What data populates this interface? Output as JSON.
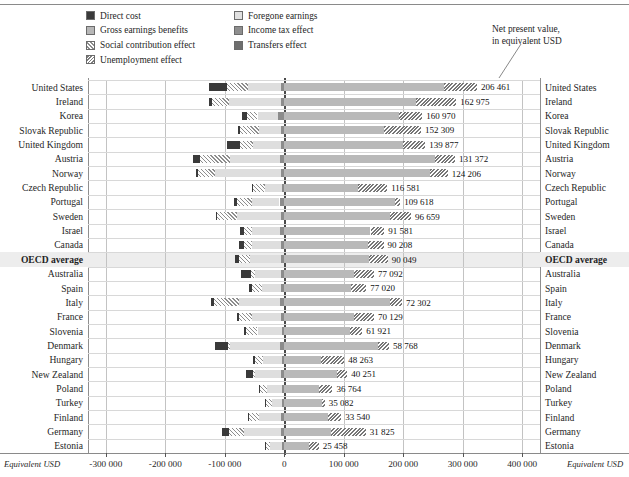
{
  "legend": {
    "column1": [
      {
        "label": "Direct cost",
        "icon": "swatch-direct-cost"
      },
      {
        "label": "Gross earnings benefits",
        "icon": "swatch-gross-earnings-benefits"
      },
      {
        "label": "Social contribution effect",
        "icon": "swatch-social-contribution-effect"
      },
      {
        "label": "Unemployment effect",
        "icon": "swatch-unemployment-effect"
      }
    ],
    "column2": [
      {
        "label": "Foregone earnings",
        "icon": "swatch-foregone-earnings"
      },
      {
        "label": "Income tax effect",
        "icon": "swatch-income-tax-effect"
      },
      {
        "label": "Transfers effect",
        "icon": "swatch-transfers-effect"
      }
    ]
  },
  "annotation": {
    "line1": "Net present value,",
    "line2": "in equivalent USD"
  },
  "axis": {
    "unit_left": "Equivalent USD",
    "unit_right": "Equivalent USD",
    "ticks": [
      "-300 000",
      "-200 000",
      "-100 000",
      "0",
      "100 000",
      "200 000",
      "300 000",
      "400 000"
    ],
    "tick_values": [
      -300000,
      -200000,
      -100000,
      0,
      100000,
      200000,
      300000,
      400000
    ]
  },
  "chart_data": {
    "type": "bar",
    "orientation": "horizontal",
    "stacked": true,
    "title": "",
    "xlabel": "Equivalent USD",
    "ylabel": "",
    "xlim": [
      -330000,
      430000
    ],
    "grid": true,
    "legend_position": "top",
    "series": [
      {
        "name": "Direct cost",
        "key": "direct_cost"
      },
      {
        "name": "Foregone earnings",
        "key": "foregone_earnings"
      },
      {
        "name": "Gross earnings benefits",
        "key": "gross_earnings_benefits"
      },
      {
        "name": "Income tax effect",
        "key": "income_tax_effect"
      },
      {
        "name": "Social contribution effect",
        "key": "social_contribution_effect"
      },
      {
        "name": "Transfers effect",
        "key": "transfers_effect"
      },
      {
        "name": "Unemployment effect",
        "key": "unemployment_effect"
      }
    ],
    "categories": [
      "United States",
      "Ireland",
      "Korea",
      "Slovak Republic",
      "United Kingdom",
      "Austria",
      "Norway",
      "Czech Republic",
      "Portugal",
      "Sweden",
      "Israel",
      "Canada",
      "OECD average",
      "Australia",
      "Spain",
      "Italy",
      "France",
      "Slovenia",
      "Denmark",
      "Hungary",
      "New Zealand",
      "Poland",
      "Turkey",
      "Finland",
      "Germany",
      "Estonia"
    ],
    "net_present_value_labels": [
      "206 461",
      "162 975",
      "160 970",
      "152 309",
      "139 877",
      "131 372",
      "124 206",
      "116 581",
      "109 618",
      "96 659",
      "91 581",
      "90 208",
      "90 049",
      "77 092",
      "77 020",
      "72 302",
      "70 129",
      "61 921",
      "58 768",
      "48 263",
      "40 251",
      "36 764",
      "35 082",
      "33 540",
      "31 825",
      "25 458"
    ],
    "net_present_value": [
      206461,
      162975,
      160970,
      152309,
      139877,
      131372,
      124206,
      116581,
      109618,
      96659,
      91581,
      90208,
      90049,
      77092,
      77020,
      72302,
      70129,
      61921,
      58768,
      48263,
      40251,
      36764,
      35082,
      33540,
      31825,
      25458
    ],
    "rows": [
      {
        "country": "United States",
        "npv": 206461,
        "direct_cost": -29000,
        "social_contribution_effect": -36000,
        "foregone_earnings": -55000,
        "income_tax_effect": -6000,
        "gross_earnings_benefits": 268000,
        "unemployment_effect": 56000,
        "transfers_effect": -4000,
        "neg_total": -126000,
        "pos_total": 324000
      },
      {
        "country": "Ireland",
        "npv": 162975,
        "direct_cost": -5000,
        "social_contribution_effect": -29000,
        "foregone_earnings": -88000,
        "income_tax_effect": -5000,
        "gross_earnings_benefits": 222000,
        "unemployment_effect": 67000,
        "transfers_effect": -3000,
        "neg_total": -127000,
        "pos_total": 289000
      },
      {
        "country": "Korea",
        "npv": 160970,
        "direct_cost": -8000,
        "social_contribution_effect": -18000,
        "foregone_earnings": -35000,
        "income_tax_effect": -10000,
        "gross_earnings_benefits": 193000,
        "unemployment_effect": 39000,
        "transfers_effect": -1000,
        "neg_total": -71000,
        "pos_total": 232000
      },
      {
        "country": "Slovak Republic",
        "npv": 152309,
        "direct_cost": -3000,
        "social_contribution_effect": -32000,
        "foregone_earnings": -37000,
        "income_tax_effect": -5000,
        "gross_earnings_benefits": 168000,
        "unemployment_effect": 62000,
        "transfers_effect": -1000,
        "neg_total": -77000,
        "pos_total": 230000
      },
      {
        "country": "United Kingdom",
        "npv": 139877,
        "direct_cost": -21000,
        "social_contribution_effect": -23000,
        "foregone_earnings": -47000,
        "income_tax_effect": -5000,
        "gross_earnings_benefits": 200000,
        "unemployment_effect": 37000,
        "transfers_effect": -2000,
        "neg_total": -96000,
        "pos_total": 237000
      },
      {
        "country": "Austria",
        "npv": 131372,
        "direct_cost": -12000,
        "social_contribution_effect": -50000,
        "foregone_earnings": -85000,
        "income_tax_effect": -7000,
        "gross_earnings_benefits": 253000,
        "unemployment_effect": 34000,
        "transfers_effect": -2000,
        "neg_total": -154000,
        "pos_total": 287000
      },
      {
        "country": "Norway",
        "npv": 124206,
        "direct_cost": -4000,
        "social_contribution_effect": -29000,
        "foregone_earnings": -110000,
        "income_tax_effect": -6000,
        "gross_earnings_benefits": 245000,
        "unemployment_effect": 30000,
        "transfers_effect": -2000,
        "neg_total": -149000,
        "pos_total": 275000
      },
      {
        "country": "Czech Republic",
        "npv": 116581,
        "direct_cost": -3000,
        "social_contribution_effect": -19000,
        "foregone_earnings": -29000,
        "income_tax_effect": -4000,
        "gross_earnings_benefits": 124000,
        "unemployment_effect": 49000,
        "transfers_effect": -1000,
        "neg_total": -55000,
        "pos_total": 173000
      },
      {
        "country": "Portugal",
        "npv": 109618,
        "direct_cost": -5000,
        "social_contribution_effect": -24000,
        "foregone_earnings": -47000,
        "income_tax_effect": -8000,
        "gross_earnings_benefits": 187000,
        "unemployment_effect": 8000,
        "transfers_effect": -1000,
        "neg_total": -85000,
        "pos_total": 195000
      },
      {
        "country": "Sweden",
        "npv": 96659,
        "direct_cost": -2000,
        "social_contribution_effect": -34000,
        "foregone_earnings": -73000,
        "income_tax_effect": -6000,
        "gross_earnings_benefits": 178000,
        "unemployment_effect": 35000,
        "transfers_effect": -2000,
        "neg_total": -115000,
        "pos_total": 213000
      },
      {
        "country": "Israel",
        "npv": 91581,
        "direct_cost": -8000,
        "social_contribution_effect": -12000,
        "foregone_earnings": -48000,
        "income_tax_effect": -7000,
        "gross_earnings_benefits": 145000,
        "unemployment_effect": 23000,
        "transfers_effect": -1000,
        "neg_total": -76000,
        "pos_total": 168000
      },
      {
        "country": "Canada",
        "npv": 90208,
        "direct_cost": -9000,
        "social_contribution_effect": -13000,
        "foregone_earnings": -48000,
        "income_tax_effect": -6000,
        "gross_earnings_benefits": 140000,
        "unemployment_effect": 27000,
        "transfers_effect": -1000,
        "neg_total": -77000,
        "pos_total": 167000
      },
      {
        "country": "OECD average",
        "npv": 90049,
        "direct_cost": -7000,
        "social_contribution_effect": -19000,
        "foregone_earnings": -51000,
        "income_tax_effect": -6000,
        "gross_earnings_benefits": 142000,
        "unemployment_effect": 32000,
        "transfers_effect": -1000,
        "neg_total": -84000,
        "pos_total": 174000
      },
      {
        "country": "Australia",
        "npv": 77092,
        "direct_cost": -17000,
        "social_contribution_effect": -7000,
        "foregone_earnings": -44000,
        "income_tax_effect": -5000,
        "gross_earnings_benefits": 118000,
        "unemployment_effect": 33000,
        "transfers_effect": -1000,
        "neg_total": -73000,
        "pos_total": 151000
      },
      {
        "country": "Spain",
        "npv": 77020,
        "direct_cost": -5000,
        "social_contribution_effect": -18000,
        "foregone_earnings": -32000,
        "income_tax_effect": -5000,
        "gross_earnings_benefits": 113000,
        "unemployment_effect": 25000,
        "transfers_effect": -1000,
        "neg_total": -60000,
        "pos_total": 138000
      },
      {
        "country": "Italy",
        "npv": 72302,
        "direct_cost": -6000,
        "social_contribution_effect": -42000,
        "foregone_earnings": -69000,
        "income_tax_effect": -7000,
        "gross_earnings_benefits": 178000,
        "unemployment_effect": 20000,
        "transfers_effect": -1000,
        "neg_total": -124000,
        "pos_total": 198000
      },
      {
        "country": "France",
        "npv": 70129,
        "direct_cost": -4000,
        "social_contribution_effect": -22000,
        "foregone_earnings": -48000,
        "income_tax_effect": -6000,
        "gross_earnings_benefits": 118000,
        "unemployment_effect": 33000,
        "transfers_effect": -1000,
        "neg_total": -80000,
        "pos_total": 151000
      },
      {
        "country": "Slovenia",
        "npv": 61921,
        "direct_cost": -3000,
        "social_contribution_effect": -20000,
        "foregone_earnings": -41000,
        "income_tax_effect": -4000,
        "gross_earnings_benefits": 110000,
        "unemployment_effect": 21000,
        "transfers_effect": -1000,
        "neg_total": -68000,
        "pos_total": 131000
      },
      {
        "country": "Denmark",
        "npv": 58768,
        "direct_cost": -22000,
        "social_contribution_effect": -3000,
        "foregone_earnings": -85000,
        "income_tax_effect": -7000,
        "gross_earnings_benefits": 158000,
        "unemployment_effect": 18000,
        "transfers_effect": -2000,
        "neg_total": -117000,
        "pos_total": 176000
      },
      {
        "country": "Hungary",
        "npv": 48263,
        "direct_cost": -3000,
        "social_contribution_effect": -14000,
        "foregone_earnings": -31000,
        "income_tax_effect": -4000,
        "gross_earnings_benefits": 61000,
        "unemployment_effect": 40000,
        "transfers_effect": -1000,
        "neg_total": -52000,
        "pos_total": 101000
      },
      {
        "country": "New Zealand",
        "npv": 40251,
        "direct_cost": -12000,
        "social_contribution_effect": -4000,
        "foregone_earnings": -44000,
        "income_tax_effect": -5000,
        "gross_earnings_benefits": 88000,
        "unemployment_effect": 18000,
        "transfers_effect": -1000,
        "neg_total": -65000,
        "pos_total": 106000
      },
      {
        "country": "Poland",
        "npv": 36764,
        "direct_cost": -3000,
        "social_contribution_effect": -11000,
        "foregone_earnings": -26000,
        "income_tax_effect": -3000,
        "gross_earnings_benefits": 59000,
        "unemployment_effect": 22000,
        "transfers_effect": -1000,
        "neg_total": -43000,
        "pos_total": 81000
      },
      {
        "country": "Turkey",
        "npv": 35082,
        "direct_cost": -3000,
        "social_contribution_effect": -9000,
        "foregone_earnings": -17000,
        "income_tax_effect": -4000,
        "gross_earnings_benefits": 63000,
        "unemployment_effect": 5000,
        "transfers_effect": -1000,
        "neg_total": -33000,
        "pos_total": 68000
      },
      {
        "country": "Finland",
        "npv": 33540,
        "direct_cost": -2000,
        "social_contribution_effect": -16000,
        "foregone_earnings": -38000,
        "income_tax_effect": -5000,
        "gross_earnings_benefits": 73000,
        "unemployment_effect": 23000,
        "transfers_effect": -1000,
        "neg_total": -62000,
        "pos_total": 96000
      },
      {
        "country": "Germany",
        "npv": 31825,
        "direct_cost": -11000,
        "social_contribution_effect": -25000,
        "foregone_earnings": -62000,
        "income_tax_effect": -6000,
        "gross_earnings_benefits": 78000,
        "unemployment_effect": 59000,
        "transfers_effect": -1000,
        "neg_total": -105000,
        "pos_total": 137000
      },
      {
        "country": "Estonia",
        "npv": 25458,
        "direct_cost": -2000,
        "social_contribution_effect": -6000,
        "foregone_earnings": -21000,
        "income_tax_effect": -3000,
        "gross_earnings_benefits": 42000,
        "unemployment_effect": 16000,
        "transfers_effect": -1000,
        "neg_total": -32000,
        "pos_total": 58000
      }
    ]
  },
  "colors": {
    "direct_cost": "#3a3a3a",
    "gross_earnings_benefits": "#b9b9b9",
    "foregone_earnings": "#dedede",
    "income_tax_effect": "#8c8c8c",
    "transfers_effect": "#454545",
    "grid": "#c3c3c3",
    "zero_axis": "#4a4a4a",
    "highlight_row": "#ededed"
  }
}
